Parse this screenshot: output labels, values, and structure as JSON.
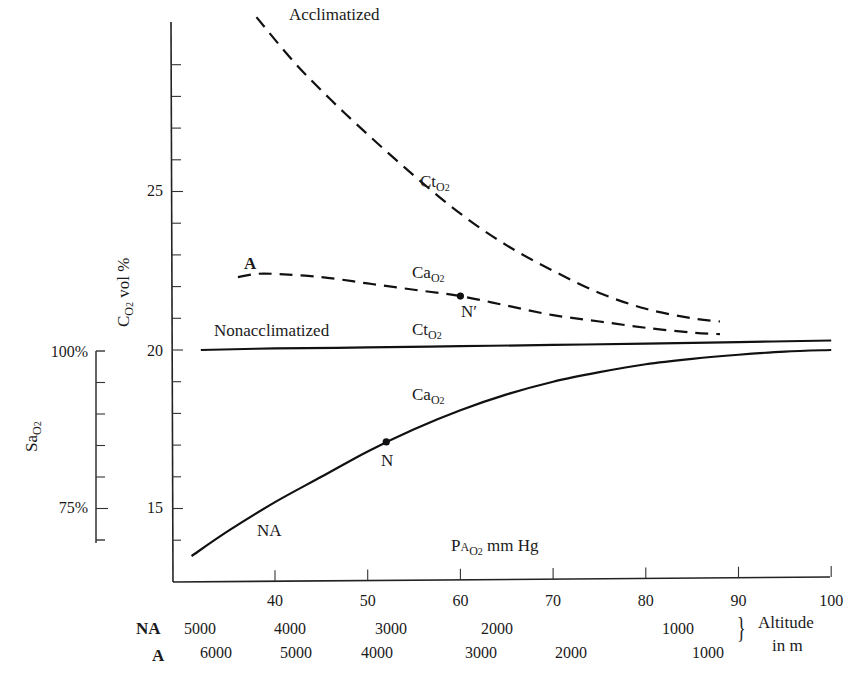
{
  "chart_data": {
    "type": "line",
    "title": "",
    "xlabel": "PA_O2 mm Hg",
    "ylabel": "C_O2 vol %",
    "secondary_ylabel": "Sa_O2",
    "xlim": [
      29,
      100
    ],
    "ylim": [
      12.7,
      30.2
    ],
    "grid": false,
    "x_ticks": [
      40,
      50,
      60,
      70,
      80,
      90,
      100
    ],
    "y_tick_labels": [
      15,
      20,
      25
    ],
    "y_minor_ticks": [
      14,
      15,
      16,
      17,
      18,
      19,
      20,
      21,
      22,
      23,
      24,
      25,
      26,
      27,
      28,
      29
    ],
    "secondary_y_ticks": {
      "labels": [
        "100%",
        "75%"
      ],
      "range_pct": [
        70,
        100
      ],
      "minor_step_pct": 5
    },
    "series": [
      {
        "name": "Acclimatized Ct_O2",
        "group": "Acclimatized",
        "style": "dashed",
        "x": [
          38,
          42,
          46,
          50,
          55,
          60,
          65,
          70,
          75,
          80,
          85,
          88
        ],
        "y": [
          30.5,
          29.1,
          27.9,
          26.8,
          25.5,
          24.3,
          23.3,
          22.5,
          21.8,
          21.3,
          21.0,
          20.9
        ]
      },
      {
        "name": "Acclimatized Ca_O2",
        "group": "Acclimatized",
        "style": "dashed",
        "x": [
          36,
          38,
          40,
          45,
          50,
          55,
          60,
          65,
          70,
          75,
          80,
          85,
          88
        ],
        "y": [
          22.3,
          22.4,
          22.4,
          22.3,
          22.1,
          21.9,
          21.7,
          21.4,
          21.1,
          20.9,
          20.7,
          20.55,
          20.5
        ]
      },
      {
        "name": "Nonacclimatized Ct_O2",
        "group": "Nonacclimatized",
        "style": "solid",
        "x": [
          32,
          40,
          50,
          60,
          70,
          80,
          90,
          100
        ],
        "y": [
          20.0,
          20.05,
          20.08,
          20.12,
          20.16,
          20.2,
          20.25,
          20.3
        ]
      },
      {
        "name": "Nonacclimatized Ca_O2",
        "group": "Nonacclimatized",
        "style": "solid",
        "x": [
          31,
          35,
          40,
          45,
          50,
          55,
          60,
          65,
          70,
          75,
          80,
          85,
          90,
          95,
          100
        ],
        "y": [
          13.5,
          14.3,
          15.2,
          16.0,
          16.8,
          17.5,
          18.1,
          18.6,
          19.0,
          19.3,
          19.55,
          19.72,
          19.85,
          19.95,
          20.0
        ]
      }
    ],
    "points": [
      {
        "label": "N",
        "x": 52,
        "y": 17.1,
        "series": "Nonacclimatized Ca_O2"
      },
      {
        "label": "N′",
        "x": 60,
        "y": 21.7,
        "series": "Acclimatized Ca_O2"
      }
    ],
    "annotations": [
      "Acclimatized",
      "Nonacclimatized",
      "A",
      "NA",
      "Ct_O2",
      "Ca_O2",
      "Ct_O2",
      "Ca_O2",
      "N",
      "N′"
    ],
    "altitude_scale": {
      "label": "Altitude in m",
      "NA": [
        {
          "alt": 5000,
          "x_approx": 31
        },
        {
          "alt": 4000,
          "x_approx": 40
        },
        {
          "alt": 3000,
          "x_approx": 51
        },
        {
          "alt": 2000,
          "x_approx": 66
        },
        {
          "alt": 1000,
          "x_approx": 84
        }
      ],
      "A": [
        {
          "alt": 6000,
          "x_approx": 33
        },
        {
          "alt": 5000,
          "x_approx": 41
        },
        {
          "alt": 4000,
          "x_approx": 49
        },
        {
          "alt": 3000,
          "x_approx": 60
        },
        {
          "alt": 2000,
          "x_approx": 70
        },
        {
          "alt": 1000,
          "x_approx": 86
        }
      ]
    }
  },
  "labels": {
    "acclimatized": "Acclimatized",
    "nonacclimatized": "Nonacclimatized",
    "a_marker": "A",
    "na_marker": "NA",
    "ct": "Ct",
    "ca": "Ca",
    "o2_sub": "O",
    "two": "2",
    "n_point": "N",
    "nprime_point": "N′",
    "y_axis_main": "C",
    "y_axis_rest": " vol %",
    "sa_main": "Sa",
    "x_axis_p": "P",
    "x_axis_a": "A",
    "x_axis_rest": " mm Hg",
    "altitude_line1": "Altitude",
    "altitude_line2": "in m",
    "row_na": "NA",
    "row_a": "A",
    "pct100": "100%",
    "pct75": "75%",
    "brace": "}"
  },
  "x_tick_labels": [
    "40",
    "50",
    "60",
    "70",
    "80",
    "90",
    "100"
  ],
  "y_tick_labels": {
    "t25": "25",
    "t20": "20",
    "t15": "15"
  },
  "altitude": {
    "na": [
      "5000",
      "4000",
      "3000",
      "2000",
      "1000"
    ],
    "a": [
      "6000",
      "5000",
      "4000",
      "3000",
      "2000",
      "1000"
    ]
  }
}
